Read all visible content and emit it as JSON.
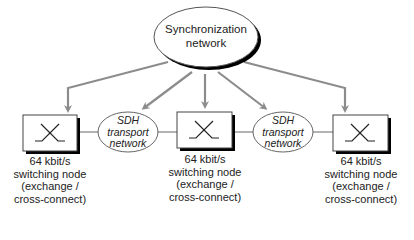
{
  "diagram": {
    "sync_network": {
      "lines": [
        "Synchronization",
        "network"
      ]
    },
    "transport_networks": [
      {
        "lines": [
          "SDH",
          "transport",
          "network"
        ]
      },
      {
        "lines": [
          "SDH",
          "transport",
          "network"
        ]
      }
    ],
    "switching_nodes": [
      {
        "icon": "switch-cross-icon",
        "lines": [
          "64 kbit/s",
          "switching node",
          "(exchange /",
          "cross-connect)"
        ]
      },
      {
        "icon": "switch-cross-icon",
        "lines": [
          "64 kbit/s",
          "switching node",
          "(exchange /",
          "cross-connect)"
        ]
      },
      {
        "icon": "switch-cross-icon",
        "lines": [
          "64 kbit/s",
          "switching node",
          "(exchange /",
          "cross-connect)"
        ]
      }
    ],
    "colors": {
      "arrow": "#8c8c8c",
      "outline": "#555555",
      "shadow": "#000000",
      "text": "#222222"
    }
  }
}
